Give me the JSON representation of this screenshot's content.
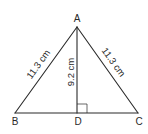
{
  "diagram": {
    "vertices": {
      "A": {
        "label": "A",
        "x": 77,
        "y": 27
      },
      "B": {
        "label": "B",
        "x": 15,
        "y": 113
      },
      "C": {
        "label": "C",
        "x": 138,
        "y": 113
      },
      "D": {
        "label": "D",
        "x": 77,
        "y": 113
      }
    },
    "measurements": {
      "AB": "11.3 cm",
      "AC": "11.3 cm",
      "AD": "9.2 cm"
    },
    "right_angle_at": "D",
    "colors": {
      "stroke": "#2a2a2a",
      "background": "#ffffff"
    }
  }
}
